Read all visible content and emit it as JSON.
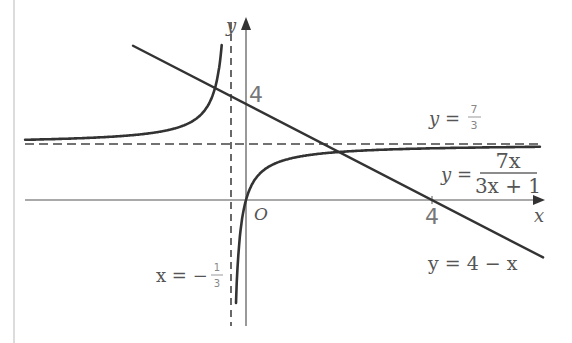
{
  "chart_data": {
    "type": "line",
    "title": "",
    "xlabel": "x",
    "ylabel": "y",
    "origin_label": "O",
    "xlim": [
      -4.75,
      6.4
    ],
    "ylim": [
      -5.25,
      7.6
    ],
    "grid": false,
    "x_ticks": [
      {
        "value": 4,
        "label": "4"
      }
    ],
    "y_ticks": [
      {
        "value": 4,
        "label": "4"
      }
    ],
    "series": [
      {
        "name": "y = 7x/(3x + 1)",
        "kind": "rational",
        "formula": "7x/(3x+1)",
        "numerator_coef": 7,
        "denominator": [
          3,
          1
        ],
        "style": "solid",
        "label": {
          "lhs": "y =",
          "numerator": "7x",
          "denominator": "3x + 1"
        },
        "sample_points": [
          {
            "x": -4.75,
            "y": 2.51
          },
          {
            "x": -2,
            "y": 2.8
          },
          {
            "x": -1,
            "y": 3.5
          },
          {
            "x": -0.6,
            "y": 5.25
          },
          {
            "x": 0,
            "y": 0
          },
          {
            "x": 1,
            "y": 1.75
          },
          {
            "x": 2,
            "y": 2.0
          },
          {
            "x": 4,
            "y": 2.15
          },
          {
            "x": 6.3,
            "y": 2.21
          }
        ]
      },
      {
        "name": "y = 4 − x",
        "kind": "linear",
        "formula": "4-x",
        "slope": -1,
        "intercept": 4,
        "x_range": [
          -2.43,
          6.39
        ],
        "style": "solid",
        "label": "y = 4 − x"
      }
    ],
    "asymptotes": [
      {
        "orientation": "horizontal",
        "value": 2.3333,
        "label_lhs": "y =",
        "label_num": "7",
        "label_den": "3",
        "style": "dashed"
      },
      {
        "orientation": "vertical",
        "value": -0.3333,
        "label_lhs": "x = −",
        "label_num": "1",
        "label_den": "3",
        "style": "dashed"
      }
    ],
    "annotations": [
      "y = 7/3",
      "x = −1/3",
      "y = 7x/(3x + 1)",
      "y = 4 − x",
      "O",
      "4",
      "4"
    ]
  },
  "layout": {
    "origin_px": [
      246,
      200
    ],
    "x_scale_px_per_unit": 46.5,
    "y_scale_px_per_unit": 24,
    "colors": {
      "curve": "#333333",
      "axis": "#555555",
      "dash": "#444444",
      "border": "#cccccc"
    }
  }
}
